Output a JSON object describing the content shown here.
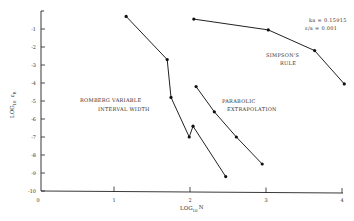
{
  "chart_data": {
    "type": "line",
    "title": "",
    "xlabel": "LOG10 N",
    "ylabel": "LOG10 εR",
    "xlim": [
      0,
      4
    ],
    "ylim": [
      -10,
      0
    ],
    "grid": false,
    "x_ticks": [
      "0",
      "1",
      "2",
      "3",
      "4"
    ],
    "y_ticks": [
      "-1",
      "-2",
      "-3",
      "-4",
      "-5",
      "-6",
      "-7",
      "-8",
      "-9",
      "-10"
    ],
    "annotations": [
      "ka = 0.15915",
      "ε/a = 0.001"
    ],
    "series": [
      {
        "name": "ROMBERG VARIABLE INTERVAL WIDTH",
        "label_lines": [
          "ROMBERG VARIABLE",
          "INTERVAL WIDTH"
        ],
        "x": [
          1.16,
          1.7,
          1.75,
          1.99,
          2.04,
          2.47
        ],
        "y": [
          -0.3,
          -2.7,
          -4.8,
          -7.0,
          -6.4,
          -9.2
        ]
      },
      {
        "name": "PARABOLIC EXTRAPOLATION",
        "label_lines": [
          "PARABOLIC",
          "EXTRAPOLATION"
        ],
        "x": [
          2.08,
          2.32,
          2.61,
          2.95
        ],
        "y": [
          -4.2,
          -5.6,
          -7.0,
          -8.5
        ]
      },
      {
        "name": "SIMPSON'S RULE",
        "label_lines": [
          "SIMPSON'S",
          "RULE"
        ],
        "x": [
          2.05,
          3.03,
          3.64,
          4.03
        ],
        "y": [
          -0.45,
          -1.05,
          -2.2,
          -4.05
        ]
      }
    ]
  },
  "axes": {
    "x_label_main": "LOG",
    "x_label_sub": "10",
    "x_label_var": "N",
    "y_label_main": "LOG",
    "y_label_sub": "10",
    "y_label_var": "ε",
    "y_label_var_sub": "R"
  }
}
